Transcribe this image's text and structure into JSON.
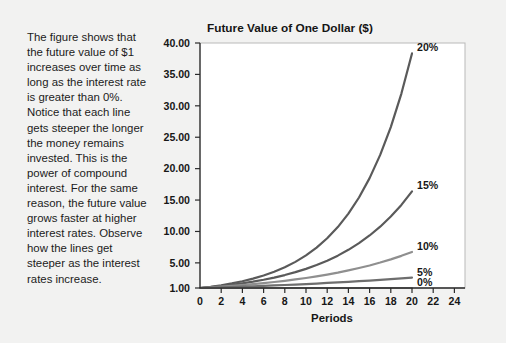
{
  "figure": {
    "background_color": "#f2f2f1",
    "caption": "The figure shows that the future value of $1 increases over time as long as the interest rate is greater than 0%. Notice that each line gets steeper the longer the money remains invested. This is the power of compound interest. For the same reason, the future value grows faster at higher interest rates. Observe how the lines get steeper as the interest rates increase."
  },
  "chart_data": {
    "type": "line",
    "title": "Future Value of One Dollar ($)",
    "xlabel": "Periods",
    "ylabel": "",
    "xlim": [
      0,
      25
    ],
    "ylim": [
      1.0,
      40.0
    ],
    "grid": false,
    "legend_position": "right-of-line-end",
    "xticks": [
      0,
      2,
      4,
      6,
      8,
      10,
      12,
      14,
      16,
      18,
      20,
      22,
      24
    ],
    "xtick_labels": [
      "0",
      "2",
      "4",
      "6",
      "8",
      "10",
      "12",
      "14",
      "16",
      "18",
      "20",
      "22",
      "24"
    ],
    "yticks": [
      1.0,
      5.0,
      10.0,
      15.0,
      20.0,
      25.0,
      30.0,
      35.0,
      40.0
    ],
    "ytick_labels": [
      "1.00",
      "5.00",
      "10.00",
      "15.00",
      "20.00",
      "25.00",
      "30.00",
      "35.00",
      "40.00"
    ],
    "x": [
      0,
      1,
      2,
      3,
      4,
      5,
      6,
      7,
      8,
      9,
      10,
      11,
      12,
      13,
      14,
      15,
      16,
      17,
      18,
      19,
      20
    ],
    "series": [
      {
        "name": "20%",
        "label": "20%",
        "rate": 0.2,
        "color": "#5a5a5a",
        "width": 2.2,
        "values": [
          1.0,
          1.2,
          1.44,
          1.73,
          2.07,
          2.49,
          2.99,
          3.58,
          4.3,
          5.16,
          6.19,
          7.43,
          8.92,
          10.7,
          12.84,
          15.41,
          18.49,
          22.19,
          26.62,
          31.95,
          38.34
        ]
      },
      {
        "name": "15%",
        "label": "15%",
        "rate": 0.15,
        "color": "#5a5a5a",
        "width": 2.2,
        "values": [
          1.0,
          1.15,
          1.32,
          1.52,
          1.75,
          2.01,
          2.31,
          2.66,
          3.06,
          3.52,
          4.05,
          4.65,
          5.35,
          6.15,
          7.08,
          8.14,
          9.36,
          10.76,
          12.38,
          14.23,
          16.37
        ]
      },
      {
        "name": "10%",
        "label": "10%",
        "rate": 0.1,
        "color": "#8f8f8f",
        "width": 2.2,
        "values": [
          1.0,
          1.1,
          1.21,
          1.33,
          1.46,
          1.61,
          1.77,
          1.95,
          2.14,
          2.36,
          2.59,
          2.85,
          3.14,
          3.45,
          3.8,
          4.18,
          4.59,
          5.05,
          5.56,
          6.12,
          6.73
        ]
      },
      {
        "name": "5%",
        "label": "5%",
        "rate": 0.05,
        "color": "#6e6e6e",
        "width": 2.2,
        "values": [
          1.0,
          1.05,
          1.1,
          1.16,
          1.22,
          1.28,
          1.34,
          1.41,
          1.48,
          1.55,
          1.63,
          1.71,
          1.8,
          1.89,
          1.98,
          2.08,
          2.18,
          2.29,
          2.41,
          2.53,
          2.65
        ]
      },
      {
        "name": "0%",
        "label": "0%",
        "rate": 0.0,
        "color": "#8a8a8a",
        "width": 2.2,
        "values": [
          1.0,
          1.0,
          1.0,
          1.0,
          1.0,
          1.0,
          1.0,
          1.0,
          1.0,
          1.0,
          1.0,
          1.0,
          1.0,
          1.0,
          1.0,
          1.0,
          1.0,
          1.0,
          1.0,
          1.0,
          1.0
        ]
      }
    ]
  }
}
